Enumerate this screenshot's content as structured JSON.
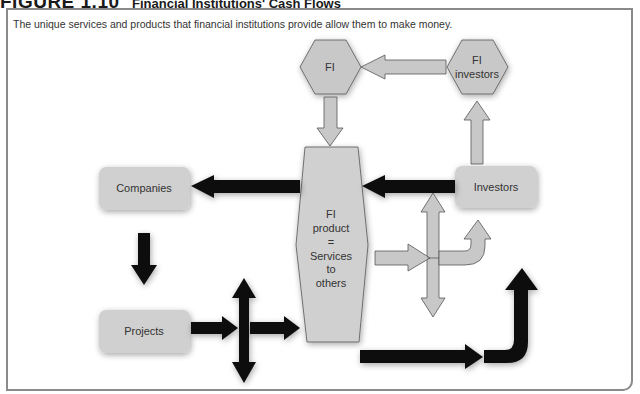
{
  "figure": {
    "number": "FIGURE 1.10",
    "title": "Financial Institutions' Cash Flows",
    "caption": "The unique services and products that financial institutions provide allow them to make money."
  },
  "nodes": {
    "fi": {
      "label": "FI",
      "shape": "hexagon"
    },
    "fi_investors": {
      "line1": "FI",
      "line2": "investors",
      "shape": "hexagon"
    },
    "fi_product": {
      "lines": [
        "FI",
        "product",
        "=",
        "Services",
        "to",
        "others"
      ],
      "shape": "tall-hexagon"
    },
    "companies": {
      "label": "Companies",
      "shape": "rounded-box"
    },
    "investors": {
      "label": "Investors",
      "shape": "rounded-box"
    },
    "projects": {
      "label": "Projects",
      "shape": "rounded-box"
    }
  },
  "edges": [
    {
      "from": "fi_investors",
      "to": "fi",
      "style": "gray"
    },
    {
      "from": "fi",
      "to": "fi_product",
      "style": "gray"
    },
    {
      "from": "investors",
      "to": "fi_investors",
      "style": "gray"
    },
    {
      "from": "investors",
      "to": "fi_product",
      "style": "black"
    },
    {
      "from": "fi_product",
      "to": "companies",
      "style": "black"
    },
    {
      "from": "companies",
      "to": "projects",
      "style": "black"
    },
    {
      "from": "projects",
      "to": "fi_product",
      "style": "black",
      "note": "with vertical double arrow crossing"
    },
    {
      "from": "fi_product",
      "to": "investors",
      "style": "gray",
      "note": "bent arrow with vertical double arrow crossing"
    },
    {
      "from": "fi_product",
      "to": "right",
      "style": "black",
      "note": "long arrow bending upward"
    }
  ],
  "colors": {
    "gray_fill": "#c8c8c8",
    "box_fill": "#d0d0d0",
    "black_arrow": "#111111",
    "frame": "#8a8a8a",
    "text": "#333333"
  }
}
